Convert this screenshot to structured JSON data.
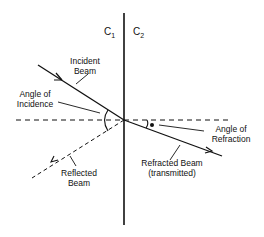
{
  "diagram": {
    "title": "",
    "media": [
      {
        "label": "C",
        "subscript": "1"
      },
      {
        "label": "C",
        "subscript": "2"
      }
    ],
    "labels": {
      "incident_beam": [
        "Incident",
        "Beam"
      ],
      "angle_of_incidence": [
        "Angle of",
        "Incidence"
      ],
      "reflected_beam": [
        "Reflected",
        "Beam"
      ],
      "angle_of_refraction": [
        "Angle of",
        "Refraction"
      ],
      "refracted_beam": [
        "Refracted Beam",
        "(transmitted)"
      ]
    },
    "colors": {
      "line": "#111111",
      "background": "#ffffff"
    }
  }
}
